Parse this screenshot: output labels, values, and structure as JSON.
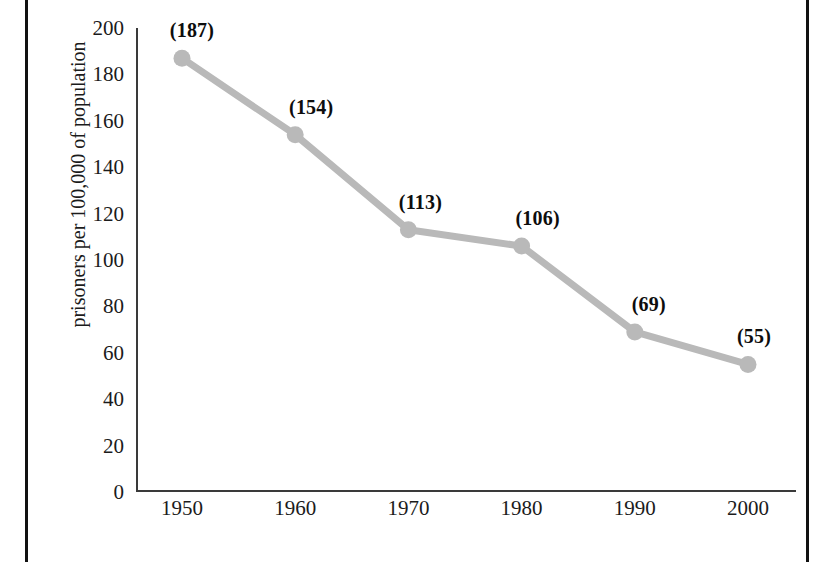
{
  "chart_data": {
    "type": "line",
    "title": "",
    "xlabel": "",
    "ylabel": "prisoners per 100,000 of population",
    "categories": [
      "1950",
      "1960",
      "1970",
      "1980",
      "1990",
      "2000"
    ],
    "x": [
      1950,
      1960,
      1970,
      1980,
      1990,
      2000
    ],
    "values": [
      187,
      154,
      113,
      106,
      69,
      55
    ],
    "point_labels": [
      "(187)",
      "(154)",
      "(113)",
      "(106)",
      "(69)",
      "(55)"
    ],
    "ylim": [
      0,
      200
    ],
    "yticks": [
      "200",
      "180",
      "160",
      "140",
      "120",
      "100",
      "80",
      "60",
      "40",
      "20",
      "0"
    ],
    "ytick_values": [
      200,
      180,
      160,
      140,
      120,
      100,
      80,
      60,
      40,
      20,
      0
    ],
    "grid": false,
    "legend": "none",
    "series_color": "#b9b9b9",
    "axis_color": "#3a3a3a",
    "text_color": "#1b1b1b",
    "frame_color": "#111111",
    "background": "#ffffff"
  }
}
